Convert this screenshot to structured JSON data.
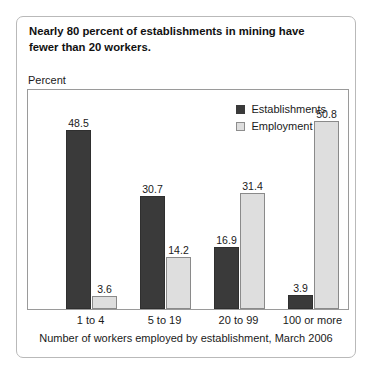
{
  "headline": {
    "line1": "Nearly 80 percent of establishments in mining have",
    "line2": "fewer than 20 workers."
  },
  "axis_title": "Percent",
  "footnote": "Number of workers employed by establishment, March 2006",
  "legend": {
    "series1": "Establishments",
    "series2": "Employment"
  },
  "colors": {
    "establishments": "#3a3a3a",
    "employment": "#dedede",
    "frame": "#9a9a9a",
    "card_border": "#b9b9b9"
  },
  "chart_data": {
    "type": "bar",
    "title": "Nearly 80 percent of establishments in mining have fewer than 20 workers.",
    "xlabel": "Number of workers employed by establishment, March 2006",
    "ylabel": "Percent",
    "categories": [
      "1 to 4",
      "5 to 19",
      "20 to 99",
      "100 or more"
    ],
    "series": [
      {
        "name": "Establishments",
        "values": [
          48.5,
          30.7,
          16.9,
          3.9
        ]
      },
      {
        "name": "Employment",
        "values": [
          3.6,
          14.2,
          31.4,
          50.8
        ]
      }
    ],
    "ylim": [
      0,
      56
    ],
    "grid": false,
    "legend_position": "top-right",
    "data_labels": true
  }
}
